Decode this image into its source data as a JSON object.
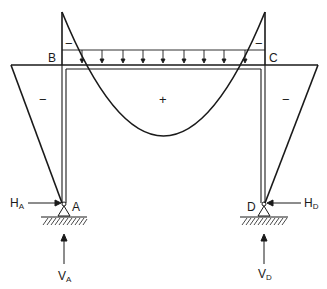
{
  "diagram": {
    "colors": {
      "ink": "#1a1a1a",
      "background": "#ffffff"
    },
    "nodes": {
      "A": {
        "label": "A"
      },
      "B": {
        "label": "B"
      },
      "C": {
        "label": "C"
      },
      "D": {
        "label": "D"
      }
    },
    "reactions": {
      "HA": {
        "main": "H",
        "sub": "A"
      },
      "VA": {
        "main": "V",
        "sub": "A"
      },
      "HD": {
        "main": "H",
        "sub": "D"
      },
      "VD": {
        "main": "V",
        "sub": "D"
      }
    },
    "signs": {
      "left_column": "−",
      "right_column": "−",
      "beam_span": "+",
      "left_corner": "−",
      "right_corner": "−"
    },
    "load": {
      "type": "uniformly distributed load",
      "arrow_count": 9
    }
  }
}
